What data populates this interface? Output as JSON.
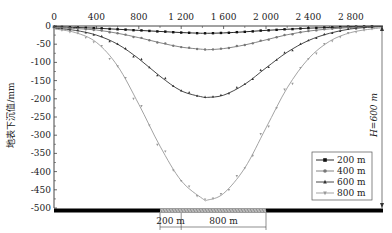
{
  "chart_data": {
    "type": "line",
    "title": "",
    "xlabel": "",
    "ylabel": "地表下沉值/mm",
    "x_ticks": [
      0,
      400,
      800,
      1200,
      1600,
      2000,
      2400,
      2800
    ],
    "x_tick_labels": [
      "0",
      "400",
      "800",
      "1 200",
      "1 600",
      "2 000",
      "2 400",
      "2 800"
    ],
    "y_ticks": [
      0,
      -50,
      -100,
      -150,
      -200,
      -250,
      -300,
      -350,
      -400,
      -450,
      -500
    ],
    "y_tick_labels": [
      "0",
      "-50",
      "-100",
      "-150",
      "-200",
      "-250",
      "-300",
      "-350",
      "-400",
      "-450",
      "-500"
    ],
    "xlim": [
      0,
      3100
    ],
    "ylim": [
      -500,
      0
    ],
    "grid": false,
    "legend_position": "lower right",
    "x": [
      0,
      200,
      400,
      600,
      800,
      1000,
      1200,
      1400,
      1450,
      1600,
      1800,
      2000,
      2200,
      2400,
      2600,
      2800,
      3000,
      3100
    ],
    "series": [
      {
        "name": "200 m",
        "marker": "square",
        "color": "#111111",
        "values": [
          -2,
          -4,
          -6,
          -9,
          -12,
          -15,
          -18,
          -20,
          -20,
          -19,
          -16,
          -12,
          -9,
          -6,
          -4,
          -2,
          -1,
          -1
        ]
      },
      {
        "name": "400 m",
        "marker": "circle",
        "color": "#777777",
        "values": [
          -4,
          -7,
          -11,
          -20,
          -32,
          -46,
          -58,
          -64,
          -65,
          -62,
          -52,
          -38,
          -24,
          -14,
          -8,
          -4,
          -2,
          -1
        ]
      },
      {
        "name": "600 m",
        "marker": "triangle-up",
        "color": "#333333",
        "values": [
          -6,
          -12,
          -25,
          -50,
          -90,
          -138,
          -178,
          -195,
          -196,
          -190,
          -160,
          -115,
          -72,
          -40,
          -20,
          -8,
          -3,
          -2
        ]
      },
      {
        "name": "800 m",
        "marker": "triangle-down",
        "color": "#999999",
        "values": [
          -8,
          -18,
          -45,
          -110,
          -215,
          -330,
          -425,
          -474,
          -478,
          -460,
          -390,
          -280,
          -170,
          -90,
          -42,
          -18,
          -8,
          -5
        ]
      }
    ],
    "annotations": [
      {
        "text": "H=600 m",
        "position": "right side, vertical dimension from 0 to -500"
      },
      {
        "text": "200 m",
        "position": "bottom, dimension below coal seam"
      },
      {
        "text": "800 m",
        "position": "bottom, dimension below coal seam"
      }
    ]
  },
  "legend": {
    "items": [
      {
        "label": "200 m",
        "marker": "square",
        "color": "#111111"
      },
      {
        "label": "400 m",
        "marker": "circle",
        "color": "#777777"
      },
      {
        "label": "600 m",
        "marker": "triangle-up",
        "color": "#333333"
      },
      {
        "label": "800 m",
        "marker": "triangle-down",
        "color": "#999999"
      }
    ]
  },
  "annotations": {
    "depth_label": "H=600 m",
    "dim_small": "200 m",
    "dim_large": "800 m"
  },
  "axis": {
    "ylabel": "地表下沉值/mm"
  }
}
